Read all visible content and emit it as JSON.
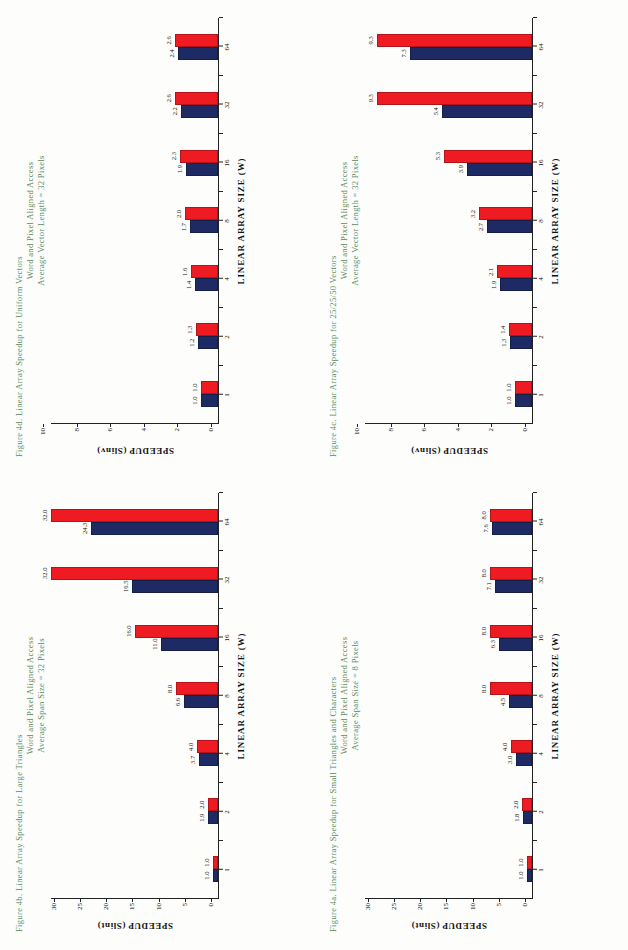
{
  "page": {
    "caption_color": "#5c8a5c",
    "series_colors": {
      "navy": "#1d2a63",
      "red": "#ee1b22"
    }
  },
  "figures": [
    {
      "id": "fig-4a",
      "caption_line1": "Figure 4a. Linear Array Speedup for Small Triangles and Characters",
      "caption_line2": "Word and Pixel Aligned Access",
      "caption_line3": "Average Span Size = 8 Pixels",
      "chart_data": {
        "type": "bar",
        "title": "Figure 4a. Linear Array Speedup for Small Triangles and Characters",
        "subtitle": "Word and Pixel Aligned Access / Average Span Size = 8 Pixels",
        "xlabel": "LINEAR ARRAY SIZE (W)",
        "ylabel": "SPEEDUP (Slint)",
        "categories": [
          "1",
          "2",
          "4",
          "8",
          "16",
          "32",
          "64"
        ],
        "yticks": [
          0,
          5,
          10,
          15,
          20,
          25,
          30
        ],
        "ylim": [
          0,
          32
        ],
        "grid": false,
        "legend": "none",
        "series": [
          {
            "name": "navy",
            "color": "#1d2a63",
            "values": [
              1.0,
              1.8,
              3.0,
              4.5,
              6.3,
              7.1,
              7.6
            ],
            "labels": [
              "1.0",
              "1.8",
              "3.0",
              "4.5",
              "6.3",
              "7.1",
              "7.6"
            ]
          },
          {
            "name": "red",
            "color": "#ee1b22",
            "values": [
              1.0,
              2.0,
              4.0,
              8.0,
              8.0,
              8.0,
              8.0
            ],
            "labels": [
              "1.0",
              "2.0",
              "4.0",
              "8.0",
              "8.0",
              "8.0",
              "8.0"
            ]
          }
        ]
      }
    },
    {
      "id": "fig-4b",
      "caption_line1": "Figure 4b. Linear Array Speedup for Large Triangles",
      "caption_line2": "Word and Pixel Aligned Access",
      "caption_line3": "Average Span Size = 32 Pixels",
      "chart_data": {
        "type": "bar",
        "title": "Figure 4b. Linear Array Speedup for Large Triangles",
        "subtitle": "Word and Pixel Aligned Access / Average Span Size = 32 Pixels",
        "xlabel": "LINEAR ARRAY SIZE (W)",
        "ylabel": "SPEEDUP (Slint)",
        "categories": [
          "1",
          "2",
          "4",
          "8",
          "16",
          "32",
          "64"
        ],
        "yticks": [
          0,
          5,
          10,
          15,
          20,
          25,
          30
        ],
        "ylim": [
          0,
          32
        ],
        "grid": false,
        "legend": "none",
        "series": [
          {
            "name": "navy",
            "color": "#1d2a63",
            "values": [
              1.0,
              1.9,
              3.7,
              6.6,
              11.0,
              16.5,
              24.3
            ],
            "labels": [
              "1.0",
              "1.9",
              "3.7",
              "6.6",
              "11.0",
              "16.5",
              "24.3"
            ]
          },
          {
            "name": "red",
            "color": "#ee1b22",
            "values": [
              1.0,
              2.0,
              4.0,
              8.0,
              16.0,
              32.0,
              32.0
            ],
            "labels": [
              "1.0",
              "2.0",
              "4.0",
              "8.0",
              "16.0",
              "32.0",
              "32.0"
            ]
          }
        ]
      }
    },
    {
      "id": "fig-4c",
      "caption_line1": "Figure 4c. Linear Array Speedup for 25/25/50 Vectors",
      "caption_line2": "Word and Pixel Aligned Access",
      "caption_line3": "Average Vector Length = 32 Pixels",
      "chart_data": {
        "type": "bar",
        "title": "Figure 4c. Linear Array Speedup for 25/25/50 Vectors",
        "subtitle": "Word and Pixel Aligned Access / Average Vector Length = 32 Pixels",
        "xlabel": "LINEAR ARRAY SIZE (W)",
        "ylabel": "SPEEDUP (Slinv)",
        "categories": [
          "1",
          "2",
          "4",
          "8",
          "16",
          "32",
          "64"
        ],
        "yticks": [
          0,
          2,
          4,
          6,
          8,
          10
        ],
        "ylim": [
          0,
          10
        ],
        "grid": false,
        "legend": "none",
        "series": [
          {
            "name": "navy",
            "color": "#1d2a63",
            "values": [
              1.0,
              1.3,
              1.9,
              2.7,
              3.9,
              5.4,
              7.3
            ],
            "labels": [
              "1.0",
              "1.3",
              "1.9",
              "2.7",
              "3.9",
              "5.4",
              "7.3"
            ]
          },
          {
            "name": "red",
            "color": "#ee1b22",
            "values": [
              1.0,
              1.4,
              2.1,
              3.2,
              5.3,
              9.3,
              9.3
            ],
            "labels": [
              "1.0",
              "1.4",
              "2.1",
              "3.2",
              "5.3",
              "9.3",
              "9.3"
            ]
          }
        ]
      }
    },
    {
      "id": "fig-4d",
      "caption_line1": "Figure 4d. Linear Array Speedup for Uniform Vectors",
      "caption_line2": "Word and Pixel Aligned Access",
      "caption_line3": "Average Vector Length = 32 Pixels",
      "chart_data": {
        "type": "bar",
        "title": "Figure 4d. Linear Array Speedup for Uniform Vectors",
        "subtitle": "Word and Pixel Aligned Access / Average Vector Length = 32 Pixels",
        "xlabel": "LINEAR ARRAY SIZE (W)",
        "ylabel": "SPEEDUP (Slinv)",
        "categories": [
          "1",
          "2",
          "4",
          "8",
          "16",
          "32",
          "64"
        ],
        "yticks": [
          0,
          2,
          4,
          6,
          8,
          10
        ],
        "ylim": [
          0,
          10
        ],
        "grid": false,
        "legend": "none",
        "series": [
          {
            "name": "navy",
            "color": "#1d2a63",
            "values": [
              1.0,
              1.2,
              1.4,
              1.7,
              1.9,
              2.2,
              2.4
            ],
            "labels": [
              "1.0",
              "1.2",
              "1.4",
              "1.7",
              "1.9",
              "2.2",
              "2.4"
            ]
          },
          {
            "name": "red",
            "color": "#ee1b22",
            "values": [
              1.0,
              1.3,
              1.6,
              2.0,
              2.3,
              2.6,
              2.6
            ],
            "labels": [
              "1.0",
              "1.3",
              "1.6",
              "2.0",
              "2.3",
              "2.6",
              "2.6"
            ]
          }
        ]
      }
    }
  ]
}
